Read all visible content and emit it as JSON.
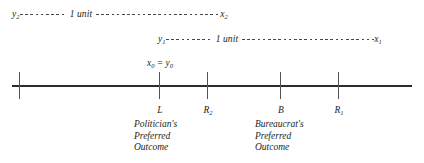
{
  "figure": {
    "type": "number-line-diagram",
    "background_color": "#ffffff",
    "line_color": "#2f2b2c",
    "text_color": "#231f20"
  },
  "spans": [
    {
      "left_endpoint": "y",
      "left_subscript": "2",
      "unit_label": "1 unit",
      "right_endpoint": "x",
      "right_subscript": "2"
    },
    {
      "left_endpoint": "y",
      "left_subscript": "1",
      "unit_label": "1 unit",
      "right_endpoint": "x",
      "right_subscript": "1"
    }
  ],
  "origin_label": {
    "x_symbol": "x",
    "x_subscript": "0",
    "equals": "=",
    "y_symbol": "y",
    "y_subscript": "0"
  },
  "axis": {
    "ticks": [
      {
        "name": "tick-0",
        "label": "",
        "subscript": ""
      },
      {
        "name": "tick-L",
        "label": "L",
        "subscript": ""
      },
      {
        "name": "tick-R2",
        "label": "R",
        "subscript": "2"
      },
      {
        "name": "tick-B",
        "label": "B",
        "subscript": ""
      },
      {
        "name": "tick-R1",
        "label": "R",
        "subscript": "1"
      }
    ]
  },
  "descriptions": [
    {
      "name": "politician",
      "line1": "Politician's",
      "line2": "Preferred",
      "line3": "Outcome"
    },
    {
      "name": "bureaucrat",
      "line1": "Bureaucrat's",
      "line2": "Preferred",
      "line3": "Outcome"
    }
  ]
}
